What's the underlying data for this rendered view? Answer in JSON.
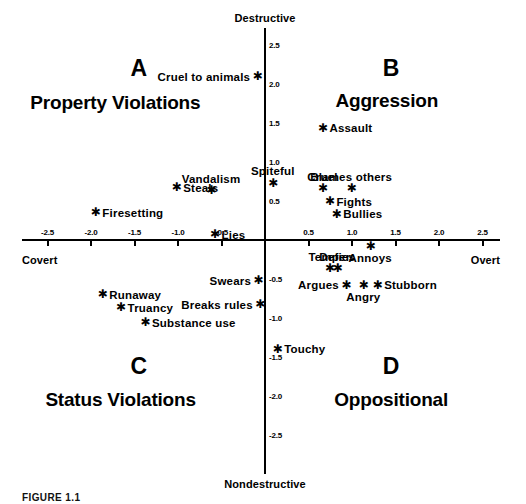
{
  "chart_data": {
    "type": "scatter",
    "title": "",
    "xlabel": "",
    "ylabel": "",
    "xlim": [
      -2.75,
      2.75
    ],
    "ylim": [
      -2.75,
      2.75
    ],
    "grid": false,
    "legend": "none",
    "axis_captions": {
      "top": "Destructive",
      "bottom": "Nondestructive",
      "left": "Covert",
      "right": "Overt"
    },
    "xticks": [
      -2.5,
      -2.0,
      -1.5,
      -1.0,
      -0.5,
      0.5,
      1.0,
      1.5,
      2.0,
      2.5
    ],
    "xtick_labels": [
      "-2.5",
      "-2.0",
      "-1.5",
      "-1.0",
      "-0.5",
      "0.5",
      "1.0",
      "1.5",
      "2.0",
      "2.5"
    ],
    "yticks": [
      2.5,
      2.0,
      1.5,
      1.0,
      0.5,
      -0.5,
      -1.0,
      -1.5,
      -2.0,
      -2.5
    ],
    "ytick_labels": [
      "2.5",
      "2.0",
      "1.5",
      "1.0",
      "0.5",
      "-0.5",
      "-1.0",
      "-1.5",
      "-2.0",
      "-2.5"
    ],
    "quadrants": [
      {
        "letter": "A",
        "title": "Property Violations",
        "letter_x": -1.45,
        "letter_y": 2.2,
        "title_x": -1.72,
        "title_y": 1.76
      },
      {
        "letter": "B",
        "title": "Aggression",
        "letter_x": 1.45,
        "letter_y": 2.2,
        "title_x": 1.4,
        "title_y": 1.78
      },
      {
        "letter": "C",
        "title": "Status Violations",
        "letter_x": -1.45,
        "letter_y": -1.62,
        "title_x": -1.66,
        "title_y": -2.05
      },
      {
        "letter": "D",
        "title": "Oppositional",
        "letter_x": 1.45,
        "letter_y": -1.62,
        "title_x": 1.45,
        "title_y": -2.05
      }
    ],
    "points": [
      {
        "label": "Cruel to animals",
        "x": -0.09,
        "y": 2.09,
        "label_pos": "left"
      },
      {
        "label": "Assault",
        "x": 0.66,
        "y": 1.43,
        "label_pos": "right"
      },
      {
        "label": "Spiteful",
        "x": 0.09,
        "y": 0.73,
        "label_pos": "above"
      },
      {
        "label": "Cruel",
        "x": 0.66,
        "y": 0.66,
        "label_pos": "above"
      },
      {
        "label": "Blames others",
        "x": 0.99,
        "y": 0.66,
        "label_pos": "above"
      },
      {
        "label": "Fights",
        "x": 0.74,
        "y": 0.49,
        "label_pos": "right"
      },
      {
        "label": "Bullies",
        "x": 0.82,
        "y": 0.33,
        "label_pos": "right"
      },
      {
        "label": "Steals",
        "x": -1.02,
        "y": 0.67,
        "label_pos": "right"
      },
      {
        "label": "Vandalism",
        "x": -0.62,
        "y": 0.63,
        "label_pos": "above"
      },
      {
        "label": "Firesetting",
        "x": -1.95,
        "y": 0.35,
        "label_pos": "right"
      },
      {
        "label": "Lies",
        "x": -0.58,
        "y": 0.07,
        "label_pos": "right"
      },
      {
        "label": "Annoys",
        "x": 1.21,
        "y": -0.08,
        "label_pos": "below"
      },
      {
        "label": "Temper",
        "x": 0.74,
        "y": -0.37,
        "label_pos": "above"
      },
      {
        "label": "Defies",
        "x": 0.83,
        "y": -0.37,
        "label_pos": "above"
      },
      {
        "label": "Argues",
        "x": 0.93,
        "y": -0.58,
        "label_pos": "left"
      },
      {
        "label": "Angry",
        "x": 1.13,
        "y": -0.58,
        "label_pos": "below"
      },
      {
        "label": "Stubborn",
        "x": 1.29,
        "y": -0.58,
        "label_pos": "right"
      },
      {
        "label": "Swears",
        "x": -0.08,
        "y": -0.52,
        "label_pos": "left"
      },
      {
        "label": "Breaks rules",
        "x": -0.06,
        "y": -0.83,
        "label_pos": "left"
      },
      {
        "label": "Runaway",
        "x": -1.87,
        "y": -0.7,
        "label_pos": "right"
      },
      {
        "label": "Truancy",
        "x": -1.66,
        "y": -0.87,
        "label_pos": "right"
      },
      {
        "label": "Substance use",
        "x": -1.38,
        "y": -1.06,
        "label_pos": "right"
      },
      {
        "label": "Touchy",
        "x": 0.14,
        "y": -1.4,
        "label_pos": "right"
      }
    ]
  },
  "caption": {
    "figure_label": "FIGURE 1.1"
  }
}
